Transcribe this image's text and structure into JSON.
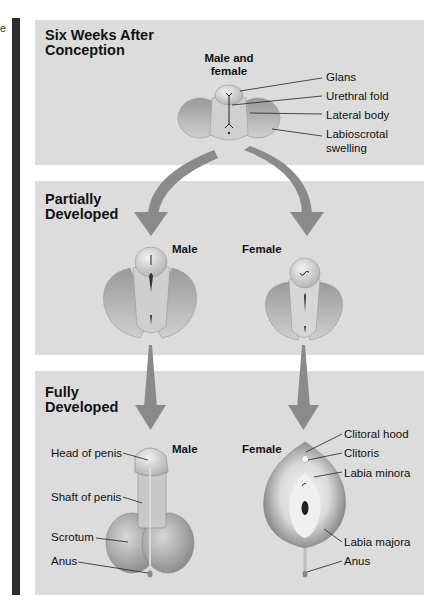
{
  "edge_text": "e",
  "colors": {
    "panel_bg": "#dcdcdc",
    "side_bar": "#2e2e2e",
    "arrow": "#8a8a8a",
    "tissue_light": "#e6e6e6",
    "tissue_mid": "#b8b8b8",
    "tissue_dark": "#8c8c8c"
  },
  "panels": [
    {
      "title": "Six Weeks After\nConception",
      "figures": [
        {
          "label": "Male and\nfemale"
        }
      ],
      "parts": [
        "Glans",
        "Urethral fold",
        "Lateral body",
        "Labioscrotal\nswelling"
      ]
    },
    {
      "title": "Partially\nDeveloped",
      "figures": [
        {
          "label": "Male"
        },
        {
          "label": "Female"
        }
      ]
    },
    {
      "title": "Fully\nDeveloped",
      "figures": [
        {
          "label": "Male",
          "parts": [
            "Head of penis",
            "Shaft of penis",
            "Scrotum",
            "Anus"
          ]
        },
        {
          "label": "Female",
          "parts": [
            "Clitoral hood",
            "Clitoris",
            "Labia minora",
            "Labia majora",
            "Anus"
          ]
        }
      ]
    }
  ]
}
